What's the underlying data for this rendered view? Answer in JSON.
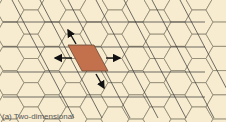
{
  "diagram": {
    "type": "hexagonal-lattice",
    "colors": {
      "hex_fill": "#f7ecd0",
      "hex_stroke": "#8a8470",
      "line": "#333333",
      "cell_fill": "#c2714c",
      "arrow": "#111111"
    },
    "hex": {
      "radius": 14,
      "rows": 5,
      "cols": 9
    },
    "horizontal_lines_y": [
      22,
      47,
      72,
      97
    ],
    "unit_cell": {
      "points": "68,45 94,45 108,71 82,71"
    },
    "arrows": [
      {
        "from": [
          76,
          44
        ],
        "to": [
          68,
          30
        ],
        "name": "arrow-up-left"
      },
      {
        "from": [
          72,
          58
        ],
        "to": [
          55,
          58
        ],
        "name": "arrow-left"
      },
      {
        "from": [
          106,
          58
        ],
        "to": [
          120,
          58
        ],
        "name": "arrow-right"
      },
      {
        "from": [
          96,
          74
        ],
        "to": [
          104,
          88
        ],
        "name": "arrow-down-right"
      }
    ]
  },
  "caption": "(a) Two-dimensional"
}
